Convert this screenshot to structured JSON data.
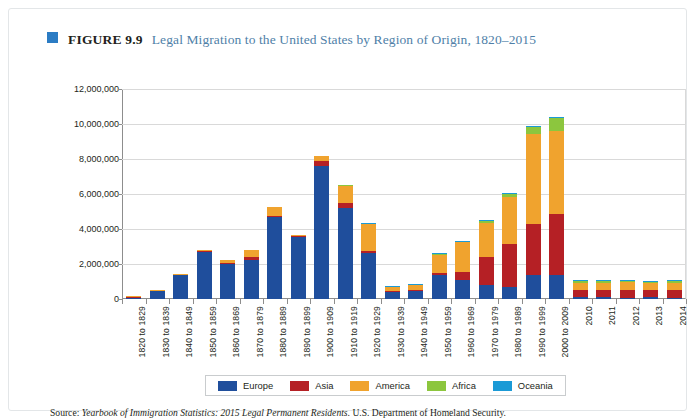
{
  "figure": {
    "bullet_icon": "square-bullet-icon",
    "number": "FIGURE 9.9",
    "title": "Legal Migration to the United States by Region of Origin, 1820–2015"
  },
  "source": {
    "prefix": "Source:",
    "italic_part": "Yearbook of Immigration Statistics: 2015 Legal Permanent Residents",
    "suffix": ". U.S. Department of Homeland Security."
  },
  "colors": {
    "europe": "#1F4E9C",
    "asia": "#B52025",
    "america": "#F0A32E",
    "africa": "#8CC63E",
    "oceania": "#1B9AD6",
    "accent": "#2b7cc4",
    "title_text": "#4f7fa8",
    "grid": "#d9d9d9",
    "axis": "#8d8d8d"
  },
  "chart_data": {
    "type": "bar",
    "stacked": true,
    "title": "Legal Migration to the United States by Region of Origin, 1820–2015",
    "xlabel": "",
    "ylabel": "",
    "ylim": [
      0,
      12000000
    ],
    "ytick_labels": [
      "12,000,000",
      "10,000,000",
      "8,000,000",
      "6,000,000",
      "4,000,000",
      "2,000,000",
      "0"
    ],
    "yticks": [
      12000000,
      10000000,
      8000000,
      6000000,
      4000000,
      2000000,
      0
    ],
    "grid": true,
    "legend_position": "bottom",
    "categories": [
      "1820 to 1829",
      "1830 to 1839",
      "1840 to 1849",
      "1850 to 1859",
      "1860 to 1869",
      "1870 to 1879",
      "1880 to 1889",
      "1890 to 1899",
      "1900 to 1909",
      "1910 to 1919",
      "1920 to 1929",
      "1930 to 1939",
      "1940 to 1949",
      "1950 to 1959",
      "1960 to 1969",
      "1970 to 1979",
      "1980 to 1989",
      "1990 to 1999",
      "2000 to 2009",
      "2010",
      "2011",
      "2012",
      "2013",
      "2014"
    ],
    "series": [
      {
        "name": "Europe",
        "color": "#1F4E9C",
        "values": [
          100000,
          480000,
          1380000,
          2700000,
          2000000,
          2250000,
          4700000,
          3550000,
          7600000,
          5200000,
          2650000,
          440000,
          470000,
          1350000,
          1100000,
          800000,
          700000,
          1350000,
          1400000,
          95000,
          90000,
          86000,
          87000,
          85000
        ]
      },
      {
        "name": "Asia",
        "color": "#B52025",
        "values": [
          5000,
          10000,
          10000,
          40000,
          65000,
          125000,
          70000,
          75000,
          300000,
          270000,
          110000,
          16000,
          37000,
          150000,
          430000,
          1590000,
          2450000,
          2950000,
          3450000,
          420000,
          430000,
          430000,
          400000,
          410000
        ]
      },
      {
        "name": "America",
        "color": "#F0A32E",
        "values": [
          15000,
          40000,
          60000,
          75000,
          170000,
          410000,
          480000,
          40000,
          280000,
          1000000,
          1550000,
          220000,
          330000,
          1050000,
          1720000,
          1980000,
          2700000,
          5150000,
          4750000,
          420000,
          420000,
          430000,
          420000,
          430000
        ]
      },
      {
        "name": "Africa",
        "color": "#8CC63E",
        "values": [
          0,
          0,
          0,
          0,
          0,
          0,
          0,
          0,
          0,
          10000,
          6000,
          2000,
          7000,
          14000,
          29000,
          81000,
          177000,
          355000,
          760000,
          100000,
          100000,
          107000,
          98000,
          98000
        ]
      },
      {
        "name": "Oceania",
        "color": "#1B9AD6",
        "values": [
          0,
          0,
          0,
          0,
          0,
          0,
          0,
          0,
          0,
          0,
          10000,
          2000,
          14000,
          12000,
          25000,
          41000,
          46000,
          56000,
          65000,
          6000,
          6000,
          6000,
          6000,
          6000
        ]
      }
    ]
  },
  "legend": {
    "items": [
      {
        "label": "Europe",
        "color": "#1F4E9C",
        "swatch": "legend-swatch-europe"
      },
      {
        "label": "Asia",
        "color": "#B52025",
        "swatch": "legend-swatch-asia"
      },
      {
        "label": "America",
        "color": "#F0A32E",
        "swatch": "legend-swatch-america"
      },
      {
        "label": "Africa",
        "color": "#8CC63E",
        "swatch": "legend-swatch-africa"
      },
      {
        "label": "Oceania",
        "color": "#1B9AD6",
        "swatch": "legend-swatch-oceania"
      }
    ]
  }
}
